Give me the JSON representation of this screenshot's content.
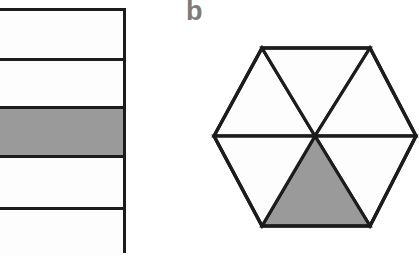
{
  "figure": {
    "background_color": "#ffffff",
    "stroke_color": "#1c1c1c",
    "fill_white": "#fdfdfd",
    "fill_shaded": "#9a9a9a",
    "label_color": "#7c7c7c"
  },
  "panel_a": {
    "name": "striped-bar",
    "label": "",
    "shape": "rectangle",
    "total_rows": 5,
    "shaded_rows": 1,
    "fraction_text": "1/5",
    "rows": [
      {
        "index": 1,
        "shaded": false,
        "top": 0,
        "height": 47
      },
      {
        "index": 2,
        "shaded": false,
        "top": 47,
        "height": 48
      },
      {
        "index": 3,
        "shaded": true,
        "top": 95,
        "height": 49
      },
      {
        "index": 4,
        "shaded": false,
        "top": 144,
        "height": 52
      },
      {
        "index": 5,
        "shaded": false,
        "top": 196,
        "height": 49
      }
    ],
    "dividers": [
      47,
      95,
      144,
      196
    ]
  },
  "panel_b": {
    "name": "hexagon",
    "label": "b",
    "shape": "hexagon",
    "total_sectors": 6,
    "shaded_sectors": 1,
    "fraction_text": "1/6",
    "center": {
      "x": 135,
      "y": 136
    },
    "vertices": [
      {
        "name": "left",
        "x": 34,
        "y": 136
      },
      {
        "name": "top-left",
        "x": 82,
        "y": 48
      },
      {
        "name": "top-right",
        "x": 190,
        "y": 48
      },
      {
        "name": "right",
        "x": 236,
        "y": 136
      },
      {
        "name": "bottom-right",
        "x": 190,
        "y": 226
      },
      {
        "name": "bottom-left",
        "x": 82,
        "y": 226
      }
    ],
    "sectors": [
      {
        "index": 1,
        "position": "top-left",
        "shaded": false,
        "points": "34,136 82,48 135,136"
      },
      {
        "index": 2,
        "position": "top-middle",
        "shaded": false,
        "points": "82,48 190,48 135,136"
      },
      {
        "index": 3,
        "position": "top-right",
        "shaded": false,
        "points": "190,48 236,136 135,136"
      },
      {
        "index": 4,
        "position": "bottom-right",
        "shaded": false,
        "points": "236,136 190,226 135,136"
      },
      {
        "index": 5,
        "position": "bottom-middle",
        "shaded": true,
        "points": "190,226 82,226 135,136"
      },
      {
        "index": 6,
        "position": "bottom-left",
        "shaded": false,
        "points": "82,226 34,136 135,136"
      }
    ],
    "internal_lines": [
      {
        "name": "horizontal-diameter",
        "x1": 34,
        "y1": 136,
        "x2": 236,
        "y2": 136
      },
      {
        "name": "diagonal-top-left",
        "x1": 82,
        "y1": 48,
        "x2": 135,
        "y2": 136
      },
      {
        "name": "diagonal-top-right",
        "x1": 190,
        "y1": 48,
        "x2": 135,
        "y2": 136
      },
      {
        "name": "diagonal-bot-left",
        "x1": 82,
        "y1": 226,
        "x2": 135,
        "y2": 136
      },
      {
        "name": "diagonal-bot-right",
        "x1": 190,
        "y1": 226,
        "x2": 135,
        "y2": 136
      }
    ]
  }
}
